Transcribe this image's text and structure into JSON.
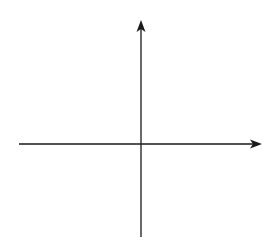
{
  "chart_data": {
    "type": "line",
    "title": "",
    "xlabel": "x",
    "ylabel": "y",
    "xlim": [
      -4,
      4
    ],
    "ylim": [
      -3,
      4
    ],
    "grid": true,
    "tick_labels": {
      "x_origin": "0",
      "x_one": "1",
      "y_one": "1"
    },
    "series": [
      {
        "name": "f(x)",
        "x": [
          -3,
          -2.5,
          -2,
          -1.5,
          -1,
          -0.5,
          0,
          0.3,
          0.5,
          1,
          1.5,
          2,
          2.5,
          3
        ],
        "y": [
          2,
          0,
          -1,
          -1.75,
          -2,
          -1.75,
          -1,
          0,
          0.7,
          2,
          2.5,
          2.8,
          2.95,
          3
        ]
      }
    ]
  },
  "labels": {
    "x_axis": "x",
    "y_axis": "y",
    "origin": "0",
    "x_tick_1": "1",
    "y_tick_1": "1"
  },
  "colors": {
    "grid": "#555555",
    "curve": "#777777",
    "axis": "#1a1a1a"
  }
}
